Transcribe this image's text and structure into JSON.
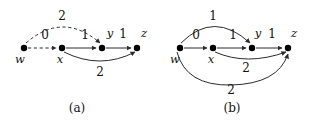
{
  "figure": {
    "stroke_color": "#2b2b2b",
    "node_color": "#000000",
    "panels": [
      {
        "id": "a",
        "caption": "(a)",
        "caption_pos": {
          "x": 77,
          "y": 108
        },
        "nodes": [
          {
            "id": "w",
            "label": "w",
            "x": 24,
            "y": 48,
            "label_pos": {
              "x": 20,
              "y": 60
            }
          },
          {
            "id": "x",
            "label": "x",
            "x": 62,
            "y": 48,
            "label_pos": {
              "x": 60,
              "y": 60
            }
          },
          {
            "id": "y",
            "label": "y",
            "x": 102,
            "y": 48,
            "label_pos": {
              "x": 110,
              "y": 34
            }
          },
          {
            "id": "z",
            "label": "z",
            "x": 137,
            "y": 48,
            "label_pos": {
              "x": 144,
              "y": 34
            }
          }
        ],
        "edges": [
          {
            "from": "w",
            "to": "x",
            "weight": "0",
            "style": "dashed",
            "shape": "straight",
            "label_pos": {
              "x": 45,
              "y": 35
            }
          },
          {
            "from": "x",
            "to": "y",
            "weight": "1",
            "style": "solid",
            "shape": "straight",
            "label_pos": {
              "x": 85,
              "y": 35
            }
          },
          {
            "from": "y",
            "to": "z",
            "weight": "1",
            "style": "solid",
            "shape": "straight",
            "label_pos": {
              "x": 123,
              "y": 34
            }
          },
          {
            "from": "w",
            "to": "y",
            "weight": "2",
            "style": "dashed",
            "shape": "arc-above",
            "label_pos": {
              "x": 62,
              "y": 16
            }
          },
          {
            "from": "x",
            "to": "z",
            "weight": "2",
            "style": "solid",
            "shape": "arc-below",
            "label_pos": {
              "x": 100,
              "y": 72
            }
          }
        ]
      },
      {
        "id": "b",
        "caption": "(b)",
        "caption_pos": {
          "x": 232,
          "y": 108
        },
        "nodes": [
          {
            "id": "w",
            "label": "w",
            "x": 180,
            "y": 48,
            "label_pos": {
              "x": 175,
              "y": 60
            }
          },
          {
            "id": "x",
            "label": "x",
            "x": 213,
            "y": 48,
            "label_pos": {
              "x": 211,
              "y": 60
            }
          },
          {
            "id": "y",
            "label": "y",
            "x": 252,
            "y": 48,
            "label_pos": {
              "x": 258,
              "y": 34
            }
          },
          {
            "id": "z",
            "label": "z",
            "x": 288,
            "y": 48,
            "label_pos": {
              "x": 294,
              "y": 34
            }
          }
        ],
        "edges": [
          {
            "from": "w",
            "to": "x",
            "weight": "0",
            "style": "solid",
            "shape": "straight",
            "label_pos": {
              "x": 196,
              "y": 35
            }
          },
          {
            "from": "x",
            "to": "y",
            "weight": "1",
            "style": "solid",
            "shape": "straight",
            "label_pos": {
              "x": 233,
              "y": 35
            }
          },
          {
            "from": "y",
            "to": "z",
            "weight": "1",
            "style": "solid",
            "shape": "straight",
            "label_pos": {
              "x": 272,
              "y": 34
            }
          },
          {
            "from": "w",
            "to": "y",
            "weight": "1",
            "style": "solid",
            "shape": "arc-above",
            "label_pos": {
              "x": 213,
              "y": 16
            }
          },
          {
            "from": "x",
            "to": "z",
            "weight": "2",
            "style": "solid",
            "shape": "arc-below",
            "label_pos": {
              "x": 246,
              "y": 68
            }
          },
          {
            "from": "w",
            "to": "z",
            "weight": "2",
            "style": "solid",
            "shape": "arc-below-far",
            "label_pos": {
              "x": 231,
              "y": 90
            }
          }
        ]
      }
    ]
  }
}
